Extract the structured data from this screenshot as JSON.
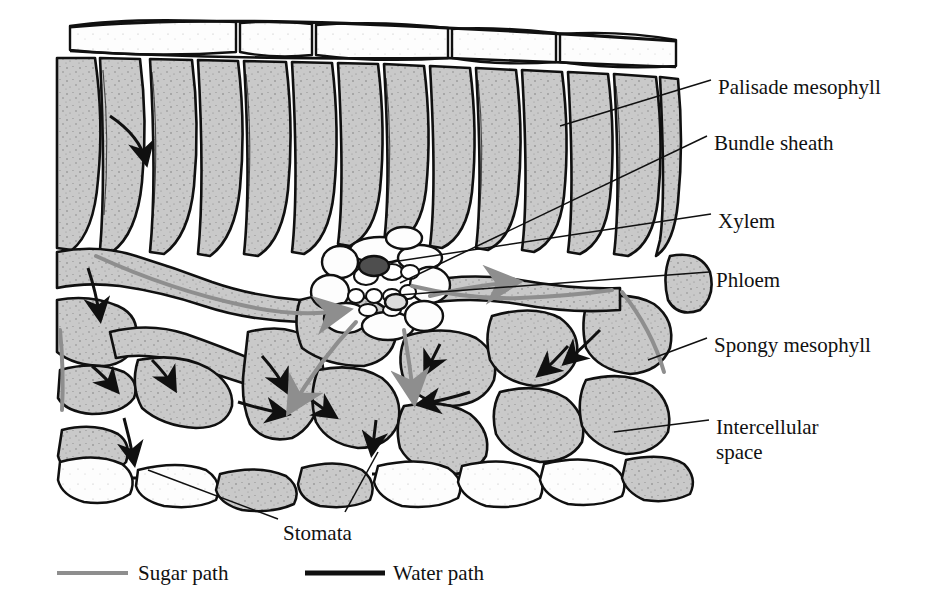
{
  "figure": {
    "background": "#ffffff",
    "colors": {
      "cell_fill": "#c9c9c9",
      "cell_fill_dark": "#b4b4b4",
      "epidermis_fill": "#fdfdfd",
      "outline": "#101010",
      "stipple": "#1a1a1a",
      "xylem_dark": "#4e4e4e",
      "sugar_path": "#8e8e8e",
      "water_path": "#101010"
    }
  },
  "labels": [
    {
      "id": "palisade-mesophyll",
      "text": "Palisade mesophyll",
      "x": 718,
      "y": 75
    },
    {
      "id": "bundle-sheath",
      "text": "Bundle sheath",
      "x": 714,
      "y": 131
    },
    {
      "id": "xylem",
      "text": "Xylem",
      "x": 718,
      "y": 209
    },
    {
      "id": "phloem",
      "text": "Phloem",
      "x": 716,
      "y": 268
    },
    {
      "id": "spongy-mesophyll",
      "text": "Spongy mesophyll",
      "x": 714,
      "y": 333
    },
    {
      "id": "intercellular-space",
      "text": "Intercellular\nspace",
      "x": 716,
      "y": 415
    },
    {
      "id": "stomata",
      "text": "Stomata",
      "x": 283,
      "y": 521
    }
  ],
  "legend": {
    "items": [
      {
        "id": "sugar-path",
        "label": "Sugar path",
        "color": "#8e8e8e",
        "line_x1": 57,
        "line_x2": 128,
        "text_x": 138,
        "y": 573,
        "width": 4
      },
      {
        "id": "water-path",
        "label": "Water path",
        "color": "#101010",
        "line_x1": 305,
        "line_x2": 385,
        "text_x": 393,
        "y": 573,
        "width": 5
      }
    ]
  },
  "leader_lines": [
    {
      "id": "leader-palisade",
      "points": "711,80 560,126"
    },
    {
      "id": "leader-bundle-sheath",
      "points": "707,136 400,283"
    },
    {
      "id": "leader-xylem",
      "points": "711,214 392,262"
    },
    {
      "id": "leader-phloem",
      "points": "709,272 399,295"
    },
    {
      "id": "leader-spongy",
      "points": "707,338 648,360"
    },
    {
      "id": "leader-intercell",
      "points": "709,420 614,432"
    },
    {
      "id": "leader-stomata-a",
      "points": "278,519 148,470"
    },
    {
      "id": "leader-stomata-b",
      "points": "345,512 378,452"
    }
  ],
  "tissue_layers": [
    {
      "id": "upper-epidermis",
      "y_top": 18,
      "y_bottom": 60,
      "description": "Upper epidermis, white rectangular cells"
    },
    {
      "id": "palisade-layer",
      "y_top": 60,
      "y_bottom": 250,
      "description": "Palisade mesophyll, tall columnar gray cells"
    },
    {
      "id": "vascular-bundle",
      "y_top": 240,
      "y_bottom": 330,
      "description": "Vascular bundle with xylem and phloem"
    },
    {
      "id": "spongy-layer",
      "y_top": 300,
      "y_bottom": 470,
      "description": "Spongy mesophyll with intercellular air spaces"
    },
    {
      "id": "lower-epidermis",
      "y_top": 450,
      "y_bottom": 510,
      "description": "Lower epidermis with stomata openings"
    }
  ]
}
